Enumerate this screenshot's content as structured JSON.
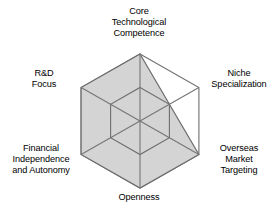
{
  "figure": {
    "name": "capability-radar-chart",
    "background_color": "#ffffff"
  },
  "chart_data": {
    "type": "radar",
    "title": "",
    "subtitle": "",
    "xlabel": "",
    "ylabel": "",
    "grid": true,
    "legend": "none",
    "rings": [
      50,
      100
    ],
    "rmin": 0,
    "rmax": 100,
    "axis_order": "clockwise-from-top",
    "categories": [
      "Core Technological Competence",
      "Niche Specialization",
      "Overseas Market Targeting",
      "Openness",
      "Financial Independence and Autonomy",
      "R&D Focus"
    ],
    "tick_labels": [],
    "series": [
      {
        "name": "",
        "values": [
          100,
          50,
          100,
          100,
          100,
          100
        ],
        "fill_color": "#d4d4d4",
        "line_color": "#6b6b6b"
      }
    ],
    "annotations": []
  },
  "labels": {
    "top": "Core\nTechnological\nCompetence",
    "upper_right": "Niche\nSpecialization",
    "lower_right": "Overseas\nMarket\nTargeting",
    "bottom": "Openness",
    "lower_left": "Financial\nIndependence\nand Autonomy",
    "upper_left": "R&D\nFocus"
  },
  "colors": {
    "fill": "#d4d4d4",
    "outline": "#5f5f5f",
    "grid": "#6e6e6e",
    "spoke": "#767676",
    "text": "#000000",
    "background": "#ffffff"
  }
}
